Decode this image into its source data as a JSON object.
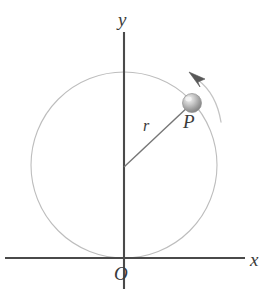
{
  "figure": {
    "labels": {
      "y_axis": "y",
      "x_axis": "x",
      "origin": "O",
      "radius": "r",
      "point": "P"
    },
    "colors": {
      "axis": "#4a4a4a",
      "circle": "#b9b9b9",
      "radius_line": "#6f6f6f",
      "ball_dark": "#8a8a8a",
      "ball_light": "#e6e6e6",
      "arrow": "#555555",
      "arc": "#c2c2c2",
      "text": "#3b3b3b",
      "background": "#ffffff"
    },
    "geometry": {
      "origin_px": [
        124,
        258
      ],
      "circle_center_px": [
        124,
        165
      ],
      "circle_radius_px": 93,
      "point_p_px": [
        192,
        103
      ],
      "radius_angle_deg": 42,
      "rotation_direction": "counterclockwise",
      "y_axis_span_px": [
        32,
        289
      ],
      "x_axis_span_px": [
        5,
        245
      ]
    }
  }
}
